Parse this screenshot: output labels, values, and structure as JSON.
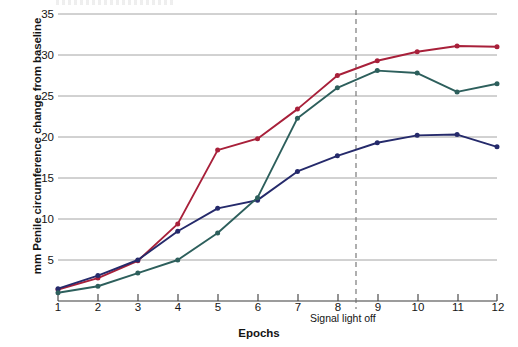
{
  "chart_data": {
    "type": "line",
    "title": "",
    "xlabel": "Epochs",
    "ylabel": "mm Penile circumference change from baseline",
    "x": [
      1,
      2,
      3,
      4,
      5,
      6,
      7,
      8,
      9,
      10,
      11,
      12
    ],
    "xtick_labels": [
      "1",
      "2",
      "3",
      "4",
      "5",
      "6",
      "7",
      "8",
      "9",
      "10",
      "11",
      "12"
    ],
    "ytick_labels": [
      "5",
      "10",
      "15",
      "20",
      "25",
      "30",
      "35"
    ],
    "yticks": [
      5,
      10,
      15,
      20,
      25,
      30,
      35
    ],
    "xlim": [
      1,
      12
    ],
    "ylim": [
      0,
      36
    ],
    "grid": "horizontal",
    "legend": "none",
    "series": [
      {
        "name": "red-series",
        "color": "#a8203a",
        "values": [
          1.4,
          2.8,
          4.9,
          9.4,
          18.4,
          19.8,
          23.4,
          27.5,
          29.3,
          30.4,
          31.1,
          31.0
        ]
      },
      {
        "name": "blue-series",
        "color": "#252a6b",
        "values": [
          1.5,
          3.1,
          5.0,
          8.5,
          11.3,
          12.3,
          15.8,
          17.7,
          19.3,
          20.2,
          20.3,
          18.8
        ]
      },
      {
        "name": "teal-series",
        "color": "#2d5f5c",
        "values": [
          1.0,
          1.8,
          3.4,
          5.0,
          8.3,
          12.6,
          22.3,
          26.0,
          28.1,
          27.8,
          25.5,
          26.5
        ]
      }
    ],
    "annotations": [
      {
        "name": "signal-light-off",
        "label": "Signal light off",
        "x": 8.45,
        "style": "vertical-dashed-line"
      }
    ]
  }
}
